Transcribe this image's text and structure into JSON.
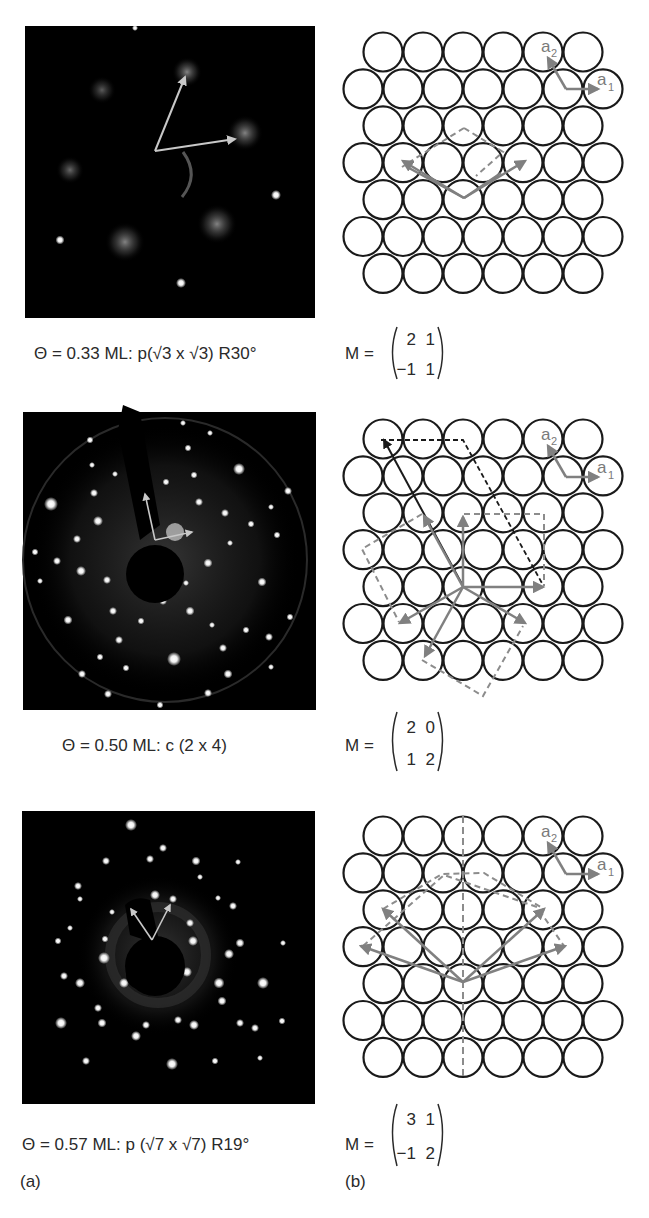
{
  "figure": {
    "panel_labels": {
      "a": "(a)",
      "b": "(b)"
    },
    "colors": {
      "background": "#ffffff",
      "leed_background": "#000000",
      "atom_stroke": "#1a1a1a",
      "vector_gray": "#808080",
      "dashed_gray": "#8c8c8c",
      "dashed_black": "#1a1a1a",
      "leed_arrow": "#c8c8c8"
    },
    "basis_vectors": {
      "a1": "a",
      "a1_sub": "1",
      "a2": "a",
      "a2_sub": "2"
    },
    "rows": [
      {
        "coverage_caption": "Θ = 0.33 ML: p(√3 x √3) R30°",
        "matrix_label": "M =",
        "matrix": [
          [
            "2",
            "1"
          ],
          [
            "−1",
            "1"
          ]
        ],
        "leed_image": "LEED pattern, diffuse spots, p(√3×√3)R30°",
        "lattice": "hexagonal close-packed surface with √3 unit cell overlay"
      },
      {
        "coverage_caption": "Θ = 0.50 ML: c (2 x 4)",
        "matrix_label": "M =",
        "matrix": [
          [
            "2",
            "0"
          ],
          [
            "1",
            "2"
          ]
        ],
        "leed_image": "LEED pattern, sharp spots, c(2×4)",
        "lattice": "hexagonal close-packed surface with c(2×4) unit cell overlays (three domains)"
      },
      {
        "coverage_caption": "Θ = 0.57 ML: p (√7 x √7) R19°",
        "matrix_label": "M =",
        "matrix": [
          [
            "3",
            "1"
          ],
          [
            "−1",
            "2"
          ]
        ],
        "leed_image": "LEED pattern, sharp spots, p(√7×√7)R19°",
        "lattice": "hexagonal close-packed surface with √7 unit cell overlays and mirror line"
      }
    ]
  }
}
